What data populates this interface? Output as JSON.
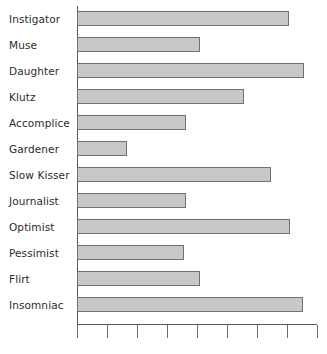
{
  "chart_data": {
    "type": "bar",
    "orientation": "horizontal",
    "title": "",
    "subtitle": "",
    "xlabel": "",
    "ylabel": "",
    "categories": [
      "Instigator",
      "Muse",
      "Daughter",
      "Klutz",
      "Accomplice",
      "Gardener",
      "Slow Kisser",
      "Journalist",
      "Optimist",
      "Pessimist",
      "Flirt",
      "Insomniac"
    ],
    "values": [
      7.07,
      4.1,
      7.57,
      5.57,
      3.63,
      1.67,
      6.47,
      3.63,
      7.1,
      3.57,
      4.1,
      7.53
    ],
    "xlim": [
      0,
      8
    ],
    "x_tick_count": 9,
    "x_tick_labels": [
      "",
      "",
      "",
      "",
      "",
      "",
      "",
      "",
      ""
    ],
    "grid": false,
    "legend": false,
    "legend_position": "none",
    "bar_fill_color": "#c8c8c8",
    "bar_border_color": "#707070",
    "axis_color": "#595959",
    "label_color": "#2b2b2b",
    "background_color": "#ffffff"
  }
}
